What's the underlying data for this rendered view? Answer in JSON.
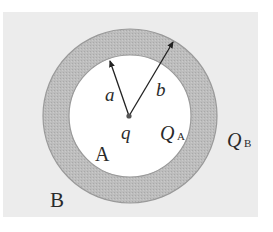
{
  "diagram": {
    "type": "concentric-spherical-shell-cross-section",
    "colors": {
      "background_panel": "#ececec",
      "inner_region": "#ffffff",
      "shell_fill": "#b9b9b9",
      "shell_edge": "#9a9a9a",
      "arrow": "#222222",
      "center_charge": "#555555"
    },
    "labels": {
      "radius_inner": "a",
      "radius_outer": "b",
      "center_charge": "q",
      "inner_conductor_charge_main": "Q",
      "inner_conductor_charge_sub": "A",
      "outer_conductor_charge_main": "Q",
      "outer_conductor_charge_sub": "B",
      "inner_region_label": "A",
      "outer_region_label": "B"
    }
  }
}
